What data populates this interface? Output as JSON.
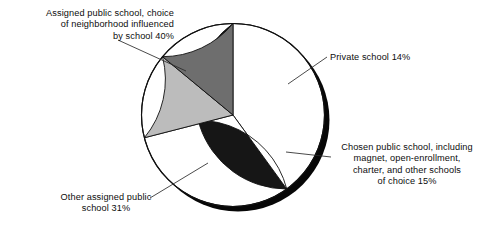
{
  "chart_data": {
    "type": "pie",
    "title": "",
    "subtitle": "",
    "xlabel": "",
    "ylabel": "",
    "legend_position": "none",
    "grid": false,
    "labels_placement": "outside-with-leader-lines",
    "start_angle_deg": 90,
    "direction": "clockwise",
    "categories": [
      "Assigned public school, choice of neighborhood influenced by school",
      "Private school",
      "Chosen public school, including magnet, open-enrollment, charter, and other schools of choice",
      "Other assigned public school"
    ],
    "values": [
      40,
      14,
      15,
      31
    ],
    "value_unit": "percent",
    "slices": [
      {
        "name": "assigned-influenced",
        "label": "Assigned public school, choice\nof neighborhood influenced\nby school 40%",
        "value": 40,
        "value_text": "40%",
        "color": "#161616"
      },
      {
        "name": "private",
        "label": "Private school 14%",
        "value": 14,
        "value_text": "14%",
        "color": "#6e6e6e"
      },
      {
        "name": "chosen-public",
        "label": "Chosen public school, including\nmagnet, open-enrollment,\ncharter, and other schools\nof choice 15%",
        "value": 15,
        "value_text": "15%",
        "color": "#bcbcbc"
      },
      {
        "name": "other-assigned",
        "label": "Other assigned public\nschool 31%",
        "value": 31,
        "value_text": "31%",
        "color": "#ffffff"
      }
    ],
    "colors": {
      "slice_assigned_influenced": "#161616",
      "slice_private": "#6e6e6e",
      "slice_chosen_public": "#bcbcbc",
      "slice_other_assigned": "#ffffff",
      "outline": "#101010",
      "shadow": "#070707",
      "leader_line": "#2b2b2b",
      "text": "#0d0d0d",
      "background": "#ffffff"
    }
  }
}
